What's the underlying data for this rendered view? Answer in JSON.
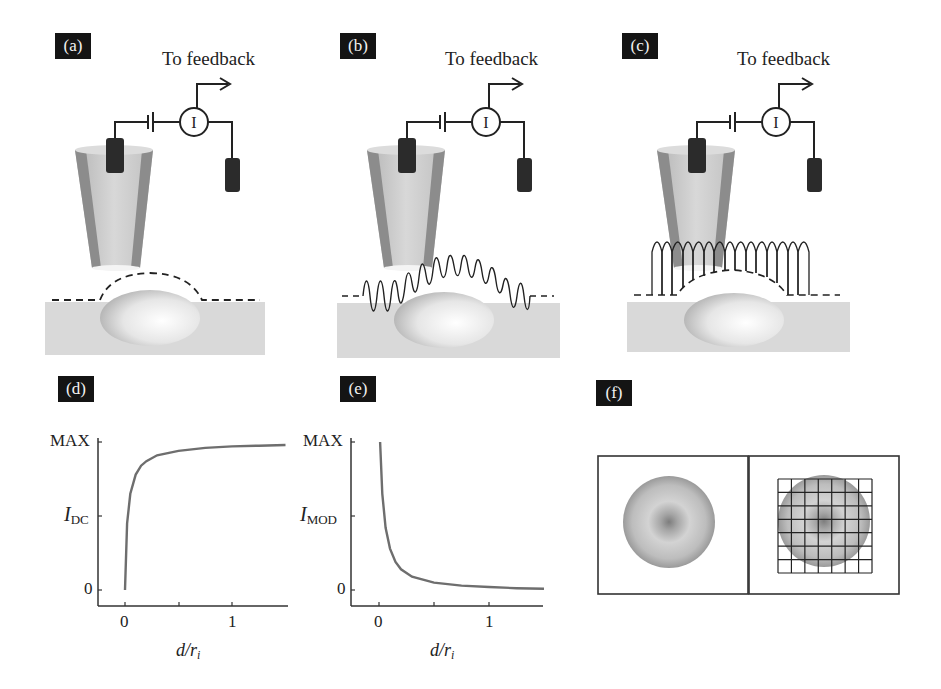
{
  "panels": {
    "a": {
      "label": "(a)",
      "feedback_text": "To feedback",
      "meter_symbol": "I",
      "mode": "DC",
      "probe_trace": "dashed-follow"
    },
    "b": {
      "label": "(b)",
      "feedback_text": "To feedback",
      "meter_symbol": "I",
      "mode": "modulated",
      "probe_trace": "oscillating"
    },
    "c": {
      "label": "(c)",
      "feedback_text": "To feedback",
      "meter_symbol": "I",
      "mode": "hopping",
      "probe_trace": "hops"
    },
    "d": {
      "label": "(d)"
    },
    "e": {
      "label": "(e)"
    },
    "f": {
      "label": "(f)",
      "grid_cells": 7
    }
  },
  "chart_data": [
    {
      "id": "d",
      "type": "line",
      "title": "",
      "xlabel": "d/r_i",
      "xlabel_main": "d/r",
      "xlabel_sub": "i",
      "ylabel": "I_DC",
      "ylabel_main": "I",
      "ylabel_sub": "DC",
      "yticks": [
        "0",
        "MAX"
      ],
      "xticks": [
        "0",
        "1"
      ],
      "xlim": [
        -0.25,
        1.5
      ],
      "ylim": [
        0,
        1
      ],
      "grid": false,
      "series": [
        {
          "name": "I_DC",
          "x": [
            0,
            0.02,
            0.05,
            0.1,
            0.15,
            0.2,
            0.3,
            0.5,
            0.75,
            1.0,
            1.25,
            1.5
          ],
          "values": [
            0.0,
            0.45,
            0.65,
            0.78,
            0.84,
            0.87,
            0.91,
            0.94,
            0.96,
            0.97,
            0.975,
            0.98
          ]
        }
      ]
    },
    {
      "id": "e",
      "type": "line",
      "title": "",
      "xlabel": "d/r_i",
      "xlabel_main": "d/r",
      "xlabel_sub": "i",
      "ylabel": "I_MOD",
      "ylabel_main": "I",
      "ylabel_sub": "MOD",
      "yticks": [
        "0",
        "MAX"
      ],
      "xticks": [
        "0",
        "1"
      ],
      "xlim": [
        -0.25,
        1.5
      ],
      "ylim": [
        0,
        1
      ],
      "grid": false,
      "series": [
        {
          "name": "I_MOD",
          "x": [
            0.01,
            0.03,
            0.06,
            0.1,
            0.15,
            0.2,
            0.3,
            0.5,
            0.75,
            1.0,
            1.25,
            1.5
          ],
          "values": [
            1.0,
            0.65,
            0.42,
            0.28,
            0.19,
            0.14,
            0.09,
            0.05,
            0.03,
            0.02,
            0.012,
            0.008
          ]
        }
      ]
    }
  ],
  "colors": {
    "label_bg": "#141414",
    "curve": "#6e6e6e",
    "axis": "#333333",
    "electrode": "#2b2b2b",
    "substrate": "#d9d9d9",
    "pipette_body": "#c9c9c9",
    "pipette_wall": "#8c8c8c"
  }
}
